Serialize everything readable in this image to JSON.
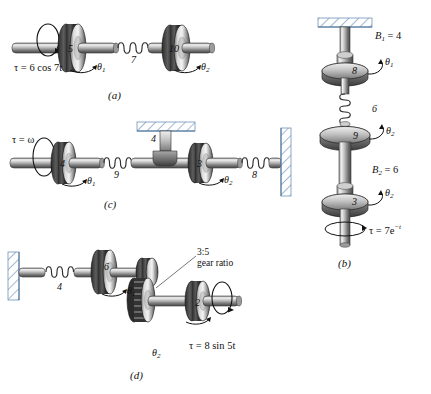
{
  "figure": {
    "panels": [
      {
        "id": "(a)",
        "name": "panel-a",
        "description": "Two inertias on a shaft coupled by a torsional spring",
        "torque": "τ = 6 cos 7t",
        "inertia_1": "5",
        "spring": "7",
        "inertia_2": "10",
        "angle_1": "θ",
        "angle_1_sub": "1",
        "angle_2": "θ",
        "angle_2_sub": "2"
      },
      {
        "id": "(b)",
        "name": "panel-b",
        "description": "Vertical shaft with three inertias, two viscous dampers and a torsional spring",
        "damper_1_label": "B",
        "damper_1_sub": "1",
        "damper_1_value": " = 4",
        "inertia_1": "8",
        "angle_1": "θ",
        "angle_1_sub": "1",
        "spring": "6",
        "inertia_2": "9",
        "angle_2": "θ",
        "angle_2_sub": "2",
        "damper_2_label": "B",
        "damper_2_sub": "2",
        "damper_2_value": " = 6",
        "inertia_3": "3",
        "angle_3": "θ",
        "angle_3_sub": "2",
        "torque": "τ = 7e",
        "torque_exp": "−t"
      },
      {
        "id": "(c)",
        "name": "panel-c",
        "description": "Driven inertia, spring, damper to ground, second inertia and spring to wall",
        "torque": "τ = ω",
        "inertia_1": "4",
        "spring_1": "9",
        "damper": "4",
        "inertia_2": "3",
        "spring_2": "8",
        "angle_1": "θ",
        "angle_1_sub": "1",
        "angle_2": "θ",
        "angle_2_sub": "2"
      },
      {
        "id": "(d)",
        "name": "panel-d",
        "description": "Spring to wall, inertia, gear pair and driven inertia",
        "spring": "4",
        "inertia_1": "6",
        "gear_ratio": "3:5\ngear ratio",
        "inertia_2": "2",
        "torque": "τ = 8 sin 5t",
        "angle_1": "θ",
        "angle_1_sub": "1",
        "angle_2": "θ",
        "angle_2_sub": "2"
      }
    ]
  },
  "colors": {
    "metal_light": "#e8e8e8",
    "metal_mid": "#9a9a9a",
    "metal_dark": "#3a3a3a",
    "hatch_blue": "#6f93b8",
    "ink": "#111111"
  }
}
